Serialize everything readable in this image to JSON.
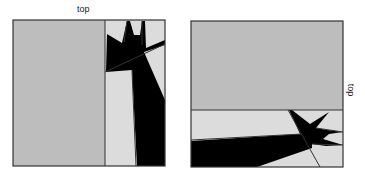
{
  "panels": [
    {
      "id": "left",
      "orientation_label": "top",
      "label_position": "above"
    },
    {
      "id": "right",
      "orientation_label": "top",
      "label_position": "right-rotated"
    }
  ],
  "colors": {
    "background": "#ffffff",
    "gray_fill": "#bdbdbd",
    "light_fill": "#dcdcdc",
    "dark_fill": "#000000",
    "border": "#333333"
  }
}
